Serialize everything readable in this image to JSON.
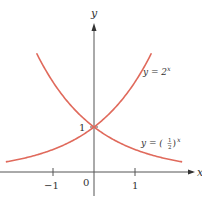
{
  "chart_data": {
    "type": "line",
    "title": "",
    "xlabel": "x",
    "ylabel": "y",
    "xlim": [
      -2.3,
      2.6
    ],
    "ylim": [
      -0.9,
      3.8
    ],
    "grid": false,
    "x_ticks": [
      {
        "value": -1,
        "label": "−1"
      },
      {
        "value": 1,
        "label": "1"
      }
    ],
    "origin_label": "0",
    "y_ticks": [
      {
        "value": 1,
        "label": "1"
      }
    ],
    "series": [
      {
        "name": "y = 2^x",
        "function": "2^x",
        "x_range": [
          -2.15,
          1.4
        ],
        "color": "#e06a5c"
      },
      {
        "name": "y = (1/2)^x",
        "function": "(1/2)^x",
        "x_range": [
          -1.4,
          2.15
        ],
        "color": "#e06a5c"
      }
    ],
    "annotations": [
      {
        "text_main": "y = 2",
        "text_sup": "x",
        "near": "upper-right of 2^x curve"
      },
      {
        "text_main": "y = (",
        "frac_num": "1",
        "frac_den": "2",
        "text_close": ")",
        "text_sup": "x",
        "near": "right of (1/2)^x curve"
      }
    ],
    "intersection": {
      "x": 0,
      "y": 1
    }
  },
  "labels": {
    "x_axis": "x",
    "y_axis": "y",
    "origin": "0",
    "tick_neg1": "−1",
    "tick_pos1": "1",
    "ytick_1": "1",
    "eq1_main": "y = 2",
    "eq1_sup": "x",
    "eq2_main": "y = (",
    "eq2_num": "1",
    "eq2_den": "2",
    "eq2_close": ")",
    "eq2_sup": "x"
  }
}
